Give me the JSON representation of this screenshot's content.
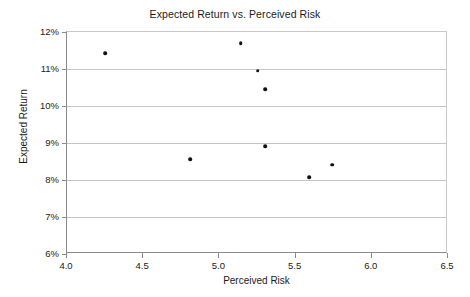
{
  "chart_data": {
    "type": "scatter",
    "title": "Expected Return vs. Perceived Risk",
    "xlabel": "Perceived Risk",
    "ylabel": "Expected Return",
    "xlim": [
      4.0,
      6.5
    ],
    "ylim": [
      6,
      12
    ],
    "xticks": [
      4.0,
      4.5,
      5.0,
      5.5,
      6.0,
      6.5
    ],
    "xtick_labels": [
      "4.0",
      "4.5",
      "5.0",
      "5.5",
      "6.0",
      "6.5"
    ],
    "yticks": [
      6,
      7,
      8,
      9,
      10,
      11,
      12
    ],
    "ytick_labels": [
      "6%",
      "7%",
      "8%",
      "9%",
      "10%",
      "11%",
      "12%"
    ],
    "grid": "horizontal",
    "legend": null,
    "marker": "filled-circle",
    "marker_color": "#111111",
    "points": [
      {
        "x": 4.25,
        "y": 11.43
      },
      {
        "x": 4.81,
        "y": 8.57
      },
      {
        "x": 5.14,
        "y": 11.7
      },
      {
        "x": 5.25,
        "y": 10.95
      },
      {
        "x": 5.3,
        "y": 10.46
      },
      {
        "x": 5.3,
        "y": 8.92
      },
      {
        "x": 5.59,
        "y": 8.08
      },
      {
        "x": 5.74,
        "y": 8.41
      }
    ]
  }
}
